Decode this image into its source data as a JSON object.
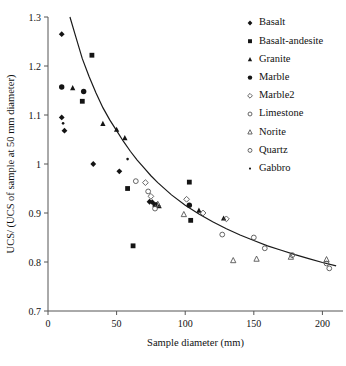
{
  "chart_data": {
    "type": "scatter",
    "title": "",
    "xlabel": "Sample diameter (mm)",
    "ylabel": "UCS/ (UCS of sample at 50 mm diameter)",
    "xlim": [
      0,
      215
    ],
    "ylim": [
      0.7,
      1.3
    ],
    "xticks": [
      0,
      50,
      100,
      150,
      200
    ],
    "yticks": [
      0.7,
      0.8,
      0.9,
      1,
      1.1,
      1.2,
      1.3
    ],
    "xticklabels": [
      "0",
      "50",
      "100",
      "150",
      "200"
    ],
    "yticklabels": [
      "0.7",
      "0.8",
      "0.9",
      "1",
      "1.1",
      "1.2",
      "1.3"
    ],
    "grid": false,
    "legend_position": "upper right",
    "series": [
      {
        "name": "Basalt",
        "marker": "filled-diamond",
        "points": [
          [
            10,
            1.265
          ],
          [
            10,
            1.095
          ],
          [
            12,
            1.068
          ],
          [
            33,
            1.0
          ],
          [
            52,
            0.985
          ],
          [
            74,
            0.923
          ],
          [
            76,
            0.922
          ]
        ]
      },
      {
        "name": "Basalt-andesite",
        "marker": "filled-square",
        "points": [
          [
            32,
            1.222
          ],
          [
            25,
            1.128
          ],
          [
            58,
            0.95
          ],
          [
            62,
            0.833
          ],
          [
            78,
            0.917
          ],
          [
            103,
            0.963
          ],
          [
            104,
            0.885
          ]
        ]
      },
      {
        "name": "Granite",
        "marker": "filled-triangle",
        "points": [
          [
            18,
            1.155
          ],
          [
            40,
            1.082
          ],
          [
            50,
            1.07
          ],
          [
            56,
            1.053
          ],
          [
            81,
            0.914
          ],
          [
            110,
            0.905
          ],
          [
            128,
            0.889
          ]
        ]
      },
      {
        "name": "Marble",
        "marker": "filled-circle",
        "points": [
          [
            10,
            1.157
          ],
          [
            26,
            1.148
          ],
          [
            103,
            0.916
          ]
        ]
      },
      {
        "name": "Marble2",
        "marker": "open-diamond",
        "points": [
          [
            71,
            0.962
          ],
          [
            75,
            0.934
          ],
          [
            101,
            0.928
          ],
          [
            113,
            0.9
          ],
          [
            130,
            0.888
          ]
        ]
      },
      {
        "name": "Limestone",
        "marker": "open-circle",
        "points": [
          [
            64,
            0.965
          ],
          [
            73,
            0.944
          ],
          [
            150,
            0.85
          ],
          [
            158,
            0.828
          ],
          [
            203,
            0.797
          ],
          [
            205,
            0.787
          ]
        ]
      },
      {
        "name": "Norite",
        "marker": "open-triangle",
        "points": [
          [
            80,
            0.918
          ],
          [
            99,
            0.897
          ],
          [
            135,
            0.803
          ],
          [
            152,
            0.806
          ],
          [
            177,
            0.81
          ],
          [
            203,
            0.805
          ]
        ]
      },
      {
        "name": "Quartz",
        "marker": "open-circle",
        "points": [
          [
            78,
            0.909
          ],
          [
            127,
            0.856
          ],
          [
            178,
            0.814
          ]
        ]
      },
      {
        "name": "Gabbro",
        "marker": "small-dot",
        "points": [
          [
            11,
            1.083
          ],
          [
            58,
            1.01
          ],
          [
            79,
            0.919
          ]
        ]
      }
    ],
    "fit_curve": {
      "name": "size-effect fit",
      "points": [
        [
          16,
          1.3
        ],
        [
          20,
          1.262
        ],
        [
          25,
          1.215
        ],
        [
          30,
          1.178
        ],
        [
          35,
          1.145
        ],
        [
          40,
          1.115
        ],
        [
          45,
          1.09
        ],
        [
          50,
          1.068
        ],
        [
          55,
          1.046
        ],
        [
          60,
          1.026
        ],
        [
          65,
          1.008
        ],
        [
          70,
          0.992
        ],
        [
          75,
          0.976
        ],
        [
          80,
          0.962
        ],
        [
          90,
          0.937
        ],
        [
          100,
          0.916
        ],
        [
          110,
          0.898
        ],
        [
          120,
          0.882
        ],
        [
          130,
          0.868
        ],
        [
          140,
          0.855
        ],
        [
          150,
          0.844
        ],
        [
          160,
          0.833
        ],
        [
          170,
          0.824
        ],
        [
          180,
          0.815
        ],
        [
          190,
          0.807
        ],
        [
          200,
          0.799
        ],
        [
          210,
          0.792
        ]
      ]
    }
  },
  "legend": {
    "items": [
      {
        "label": "Basalt",
        "marker": "filled-diamond"
      },
      {
        "label": "Basalt-andesite",
        "marker": "filled-square"
      },
      {
        "label": "Granite",
        "marker": "filled-triangle"
      },
      {
        "label": "Marble",
        "marker": "filled-circle"
      },
      {
        "label": "Marble2",
        "marker": "open-diamond"
      },
      {
        "label": "Limestone",
        "marker": "open-circle"
      },
      {
        "label": "Norite",
        "marker": "open-triangle"
      },
      {
        "label": "Quartz",
        "marker": "open-circle"
      },
      {
        "label": "Gabbro",
        "marker": "small-dot"
      }
    ]
  },
  "colors": {
    "marker_fill": "#141414",
    "marker_stroke": "#555555",
    "curve": "#1a1a1a",
    "axis": "#555555",
    "background": "#ffffff"
  }
}
